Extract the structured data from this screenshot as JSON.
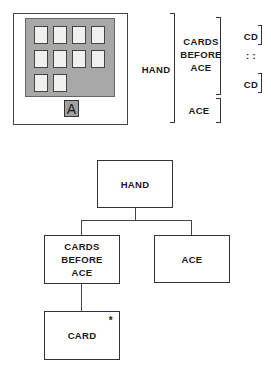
{
  "picture": {
    "card_rows": [
      4,
      4,
      2
    ],
    "ace_label": "A",
    "colors": {
      "table": "#a8a8a8",
      "card": "#f0f0ee",
      "ace_box": "#a0a0a0"
    }
  },
  "bracket_diagram": {
    "root": "HAND",
    "group": [
      "CARDS",
      "BEFORE",
      "ACE"
    ],
    "ace": "ACE",
    "card_top": "CD",
    "ellipsis": ": :",
    "card_bottom": "CD"
  },
  "tree": {
    "root": "HAND",
    "left": [
      "CARDS",
      "BEFORE",
      "ACE"
    ],
    "right": "ACE",
    "leaf": "CARD",
    "iteration_mark": "*"
  }
}
